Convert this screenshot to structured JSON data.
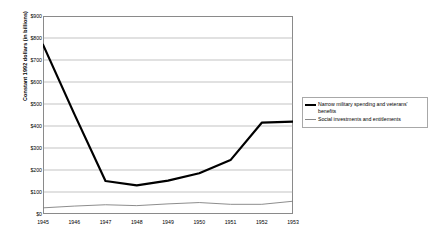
{
  "chart_data": {
    "type": "line",
    "title": "",
    "xlabel": "",
    "ylabel": "Constant 1992 dollars (in billions)",
    "grid": true,
    "legend_position": "right",
    "x": [
      1945,
      1946,
      1947,
      1948,
      1949,
      1950,
      1951,
      1952,
      1953
    ],
    "categories": [
      "1945",
      "1946",
      "1947",
      "1948",
      "1949",
      "1950",
      "1951",
      "1952",
      "1953"
    ],
    "xlim": [
      1945,
      1953
    ],
    "ylim": [
      0,
      900
    ],
    "ytick_labels": [
      "$900",
      "$800",
      "$700",
      "$600",
      "$500",
      "$400",
      "$300",
      "$200",
      "$100",
      "$0"
    ],
    "ytick_values": [
      900,
      800,
      700,
      600,
      500,
      400,
      300,
      200,
      100,
      0
    ],
    "series": [
      {
        "name": "Narrow military spending and veterans' benefits",
        "values": [
          770,
          455,
          150,
          130,
          152,
          185,
          245,
          415,
          420
        ],
        "color": "#000000",
        "width": 2.2
      },
      {
        "name": "Social investments and entitlements",
        "values": [
          28,
          36,
          42,
          38,
          46,
          52,
          44,
          44,
          58
        ],
        "color": "#808080",
        "width": 0.9
      }
    ]
  },
  "legend": {
    "items": [
      {
        "label": "Narrow military spending and veterans' benefits",
        "style": "thick"
      },
      {
        "label": "Social investments and entitlements",
        "style": "thin"
      }
    ]
  }
}
